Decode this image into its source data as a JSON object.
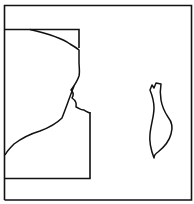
{
  "map": {
    "width": 194,
    "height": 204,
    "background": "#ffffff",
    "stroke_color": "#111111",
    "outer_frame": {
      "x": 4,
      "y": 5,
      "w": 188,
      "h": 195
    },
    "inset_frame": {
      "x": 4,
      "y": 29,
      "w": 86,
      "h": 150
    },
    "features": [
      {
        "name": "mainland-coastline"
      },
      {
        "name": "island-outline"
      }
    ]
  }
}
